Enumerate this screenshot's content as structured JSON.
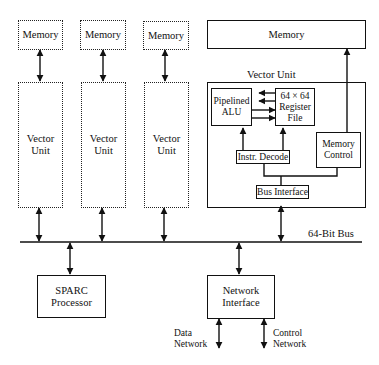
{
  "diagram": {
    "type": "block-diagram",
    "nodes": {
      "memory_1": "Memory",
      "memory_2": "Memory",
      "memory_3": "Memory",
      "memory_main": "Memory",
      "vector_unit_1": "Vector Unit",
      "vector_unit_2": "Vector Unit",
      "vector_unit_3": "Vector Unit",
      "vector_unit_detail_title": "Vector Unit",
      "pipelined_alu": "Pipelined ALU",
      "register_file": "64 × 64 Register File",
      "instr_decode": "Instr. Decode",
      "memory_control": "Memory Control",
      "bus_interface": "Bus Interface",
      "bus": "64-Bit Bus",
      "sparc": "SPARC Processor",
      "network_interface": "Network Interface",
      "data_network": "Data Network",
      "control_network": "Control Network"
    },
    "edges": [
      {
        "from": "memory_1",
        "to": "vector_unit_1",
        "bidirectional": true
      },
      {
        "from": "memory_2",
        "to": "vector_unit_2",
        "bidirectional": true
      },
      {
        "from": "memory_3",
        "to": "vector_unit_3",
        "bidirectional": true
      },
      {
        "from": "memory_main",
        "to": "memory_control",
        "bidirectional": true
      },
      {
        "from": "register_file",
        "to": "pipelined_alu",
        "count": 2
      },
      {
        "from": "pipelined_alu",
        "to": "register_file",
        "count": 2
      },
      {
        "from": "instr_decode",
        "to": "pipelined_alu"
      },
      {
        "from": "instr_decode",
        "to": "register_file"
      },
      {
        "from": "bus_interface",
        "to": "instr_decode"
      },
      {
        "from": "bus_interface",
        "to": "memory_control"
      },
      {
        "from": "vector_unit_1",
        "to": "bus",
        "bidirectional": true
      },
      {
        "from": "vector_unit_2",
        "to": "bus",
        "bidirectional": true
      },
      {
        "from": "vector_unit_3",
        "to": "bus",
        "bidirectional": true
      },
      {
        "from": "bus_interface",
        "to": "bus",
        "bidirectional": true
      },
      {
        "from": "sparc",
        "to": "bus",
        "bidirectional": true
      },
      {
        "from": "network_interface",
        "to": "bus",
        "bidirectional": true
      },
      {
        "from": "network_interface",
        "to": "data_network",
        "bidirectional": true
      },
      {
        "from": "network_interface",
        "to": "control_network",
        "bidirectional": true
      }
    ]
  },
  "labels": {
    "memory": "Memory",
    "vector": "Vector",
    "unit": "Unit",
    "vector_unit_title": "Vector Unit",
    "pipelined": "Pipelined",
    "alu": "ALU",
    "reg_size": "64 × 64",
    "register": "Register",
    "file": "File",
    "instr_decode": "Instr. Decode",
    "memory_word": "Memory",
    "control_word": "Control",
    "bus_interface": "Bus Interface",
    "bus": "64-Bit Bus",
    "sparc": "SPARC",
    "processor": "Processor",
    "network": "Network",
    "interface": "Interface",
    "data": "Data",
    "data_network": "Network",
    "control": "Control",
    "control_network": "Network"
  }
}
